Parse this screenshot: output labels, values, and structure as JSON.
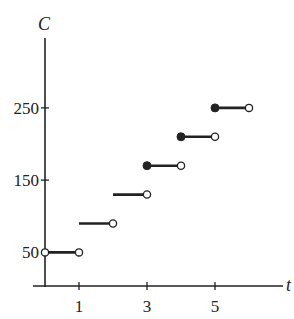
{
  "chart_data": {
    "type": "line",
    "subtype": "step",
    "title": "",
    "xlabel": "t",
    "ylabel": "C",
    "xlim": [
      0,
      6.5
    ],
    "ylim": [
      0,
      290
    ],
    "x_ticks": [
      1,
      3,
      5
    ],
    "x_tick_labels": [
      "1",
      "3",
      "5"
    ],
    "y_ticks": [
      50,
      150,
      250
    ],
    "y_tick_labels": [
      "50",
      "150",
      "250"
    ],
    "grid": false,
    "legend": null,
    "segments": [
      {
        "x_start": 0,
        "x_end": 1,
        "y": 50,
        "left": "open",
        "right": "open"
      },
      {
        "x_start": 1,
        "x_end": 2,
        "y": 90,
        "left": "none",
        "right": "open"
      },
      {
        "x_start": 2,
        "x_end": 3,
        "y": 130,
        "left": "none",
        "right": "open"
      },
      {
        "x_start": 3,
        "x_end": 4,
        "y": 170,
        "left": "closed",
        "right": "open"
      },
      {
        "x_start": 4,
        "x_end": 5,
        "y": 210,
        "left": "closed",
        "right": "open"
      },
      {
        "x_start": 5,
        "x_end": 6,
        "y": 250,
        "left": "closed",
        "right": "open"
      }
    ]
  },
  "style": {
    "line_color": "#222222",
    "background": "#ffffff"
  }
}
